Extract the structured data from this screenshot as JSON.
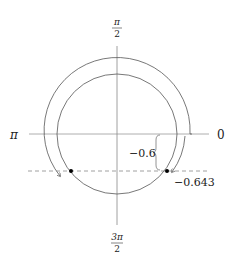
{
  "diagram": {
    "type": "unit-circle-angle-diagram",
    "axis_labels": {
      "right": "0",
      "left": "π",
      "top": {
        "numerator": "π",
        "denominator": "2"
      },
      "bottom": {
        "numerator": "3π",
        "denominator": "2"
      }
    },
    "annotations": {
      "brace_label": "−0.6",
      "angle_label": "−0.643"
    },
    "geometry": {
      "center": [
        117,
        134
      ],
      "inner_radius": 60,
      "outer_radius": 72,
      "dashed_line_y": 171,
      "points": [
        [
          71,
          171
        ],
        [
          167,
          171
        ]
      ]
    },
    "colors": {
      "stroke": "#555555",
      "axis": "#888888",
      "point": "#000000",
      "text": "#222222"
    }
  }
}
